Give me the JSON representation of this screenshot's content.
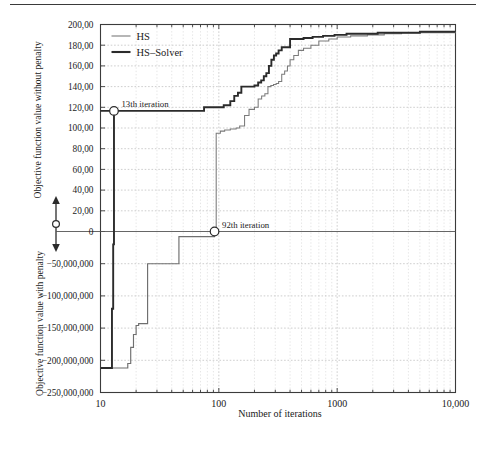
{
  "figure": {
    "domain": "chart",
    "top_rule": true
  },
  "axes": {
    "xlabel": "Number of iterations",
    "ylabel_upper": "Objective function value without penalty",
    "ylabel_lower": "Objective function value with penalty",
    "x_ticks": [
      "10",
      "100",
      "1000",
      "10,000"
    ],
    "y_ticks_upper": [
      "200,00",
      "180,00",
      "160,00",
      "140,00",
      "120,00",
      "100,00",
      "80,00",
      "60,00",
      "40,00",
      "20,00",
      "0"
    ],
    "y_ticks_lower": [
      "−50,000,000",
      "−100,000,000",
      "−150,000,000",
      "−200,000,000",
      "−250,000,000"
    ]
  },
  "legend": {
    "position": "top-left-inside",
    "entries": [
      {
        "label": "HS",
        "style": "thin-gray-line",
        "color": "#7a7a7a"
      },
      {
        "label": "HS–Solver",
        "style": "thick-black-line",
        "color": "#2b2b2b"
      }
    ]
  },
  "annotations": [
    {
      "name": "annotation-13th-iteration",
      "text": "13th iteration",
      "x_value": 13,
      "y_value": 116.5,
      "marker": "open-circle"
    },
    {
      "name": "annotation-92th-iteration",
      "text": "92th iteration",
      "x_value": 92,
      "y_value": 0,
      "marker": "open-circle"
    }
  ],
  "chart_data": {
    "type": "line",
    "title": "",
    "xlabel": "Number of iterations",
    "ylabel": "Objective function value without penalty / with penalty",
    "xscale": "log",
    "xlim": [
      10,
      10000
    ],
    "ylim_upper": [
      0,
      200
    ],
    "ylim_lower": [
      -250000000,
      0
    ],
    "grid": true,
    "legend_position": "upper left",
    "axis_break": {
      "present": true,
      "marker": "double-headed-vertical-arrow-with-circle",
      "at_value": 0
    },
    "series": [
      {
        "name": "HS",
        "panel": "upper",
        "color": "#7a7a7a",
        "step": true,
        "points": [
          [
            92,
            0
          ],
          [
            95,
            95
          ],
          [
            103,
            97
          ],
          [
            112,
            98
          ],
          [
            125,
            99
          ],
          [
            140,
            100
          ],
          [
            150,
            102
          ],
          [
            165,
            112
          ],
          [
            180,
            118
          ],
          [
            200,
            120
          ],
          [
            215,
            128
          ],
          [
            230,
            131
          ],
          [
            245,
            133
          ],
          [
            260,
            140
          ],
          [
            275,
            141
          ],
          [
            290,
            142
          ],
          [
            305,
            143
          ],
          [
            320,
            145
          ],
          [
            340,
            152
          ],
          [
            360,
            155
          ],
          [
            380,
            160
          ],
          [
            400,
            166
          ],
          [
            430,
            170
          ],
          [
            470,
            175
          ],
          [
            520,
            177
          ],
          [
            600,
            180
          ],
          [
            700,
            184
          ],
          [
            850,
            186
          ],
          [
            1000,
            188
          ],
          [
            1300,
            189
          ],
          [
            1800,
            190
          ],
          [
            2500,
            191
          ],
          [
            3500,
            192
          ],
          [
            6000,
            192
          ],
          [
            10000,
            193
          ]
        ]
      },
      {
        "name": "HS-Solver",
        "panel": "upper",
        "color": "#2b2b2b",
        "step": true,
        "points": [
          [
            10,
            116.5
          ],
          [
            13,
            116.5
          ],
          [
            60,
            116.5
          ],
          [
            75,
            120
          ],
          [
            95,
            120
          ],
          [
            110,
            122
          ],
          [
            125,
            126
          ],
          [
            135,
            131
          ],
          [
            145,
            134
          ],
          [
            155,
            140
          ],
          [
            175,
            140
          ],
          [
            200,
            141
          ],
          [
            215,
            144
          ],
          [
            228,
            146
          ],
          [
            240,
            150
          ],
          [
            252,
            153
          ],
          [
            265,
            160
          ],
          [
            278,
            166
          ],
          [
            292,
            170
          ],
          [
            305,
            172
          ],
          [
            320,
            175
          ],
          [
            340,
            178
          ],
          [
            365,
            178
          ],
          [
            400,
            186
          ],
          [
            460,
            186
          ],
          [
            520,
            187
          ],
          [
            620,
            188
          ],
          [
            760,
            189
          ],
          [
            950,
            190
          ],
          [
            1200,
            191
          ],
          [
            1600,
            191
          ],
          [
            2200,
            192
          ],
          [
            3200,
            192
          ],
          [
            5000,
            193
          ],
          [
            10000,
            193
          ]
        ]
      },
      {
        "name": "HS-penalty-branch",
        "panel": "lower",
        "color": "#6f6f6f",
        "step": true,
        "points": [
          [
            10,
            -212000000
          ],
          [
            16,
            -212000000
          ],
          [
            17,
            -205000000
          ],
          [
            18,
            -180000000
          ],
          [
            19,
            -160000000
          ],
          [
            20,
            -146000000
          ],
          [
            21,
            -143000000
          ],
          [
            23,
            -143000000
          ],
          [
            25,
            -50000000
          ],
          [
            42,
            -50000000
          ],
          [
            46,
            -8000000
          ],
          [
            72,
            -8000000
          ],
          [
            92,
            0
          ]
        ]
      },
      {
        "name": "HS-Solver-penalty-branch",
        "panel": "lower",
        "color": "#2b2b2b",
        "step": true,
        "points": [
          [
            10,
            -212000000
          ],
          [
            12,
            -212000000
          ],
          [
            12.5,
            -120000000
          ],
          [
            12.8,
            -20000000
          ],
          [
            13,
            116.5
          ]
        ]
      }
    ]
  }
}
